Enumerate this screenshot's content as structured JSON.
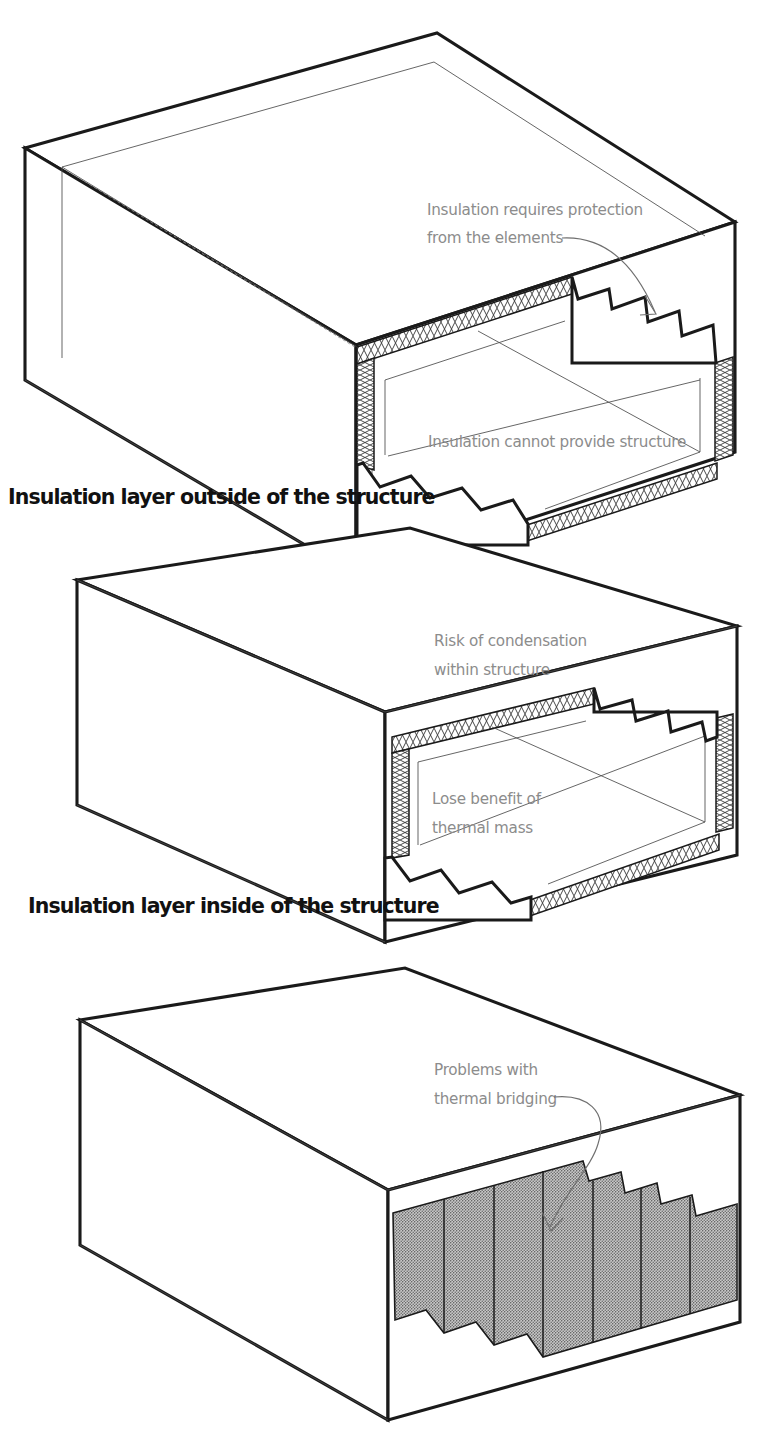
{
  "figure": {
    "background_color": "#ffffff",
    "line_color": "#1a1a1a",
    "note_color": "#8c8c8c",
    "caption_color": "#111111",
    "insulation_fill_color": "#9a9a9a"
  },
  "panels": [
    {
      "id": "outside",
      "caption": "Insulation layer outside of the structure",
      "notes": [
        {
          "lines": [
            "Insulation requires protection",
            "from the elements"
          ]
        },
        {
          "lines": [
            "Insulation cannot provide structure"
          ]
        }
      ]
    },
    {
      "id": "inside",
      "caption": "Insulation layer inside of the structure",
      "notes": [
        {
          "lines": [
            "Risk of condensation",
            "within structure"
          ]
        },
        {
          "lines": [
            "Lose benefit of",
            "thermal mass"
          ]
        }
      ]
    },
    {
      "id": "within",
      "caption": "",
      "notes": [
        {
          "lines": [
            "Problems with",
            "thermal bridging"
          ]
        }
      ]
    }
  ],
  "notes_flat": {
    "p1_n1_l1": "Insulation requires protection",
    "p1_n1_l2": "from the elements",
    "p1_n2_l1": "Insulation cannot provide structure",
    "p2_n1_l1": "Risk of condensation",
    "p2_n1_l2": "within structure",
    "p2_n2_l1": "Lose benefit of",
    "p2_n2_l2": "thermal mass",
    "p3_n1_l1": "Problems with",
    "p3_n1_l2": "thermal bridging"
  },
  "captions": {
    "c1": "Insulation layer outside of the structure",
    "c2": "Insulation layer inside of the structure"
  }
}
